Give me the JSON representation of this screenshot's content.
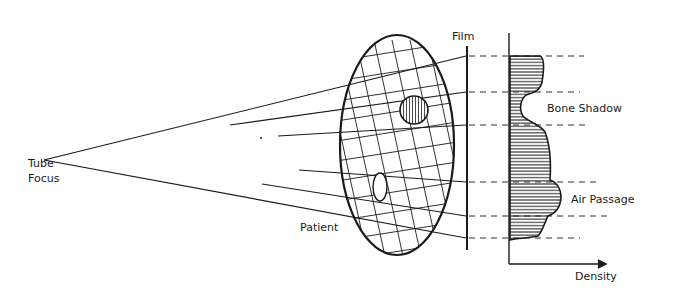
{
  "labels": {
    "tube_focus_line1": "Tube",
    "tube_focus_line2": "Focus",
    "film": "Film",
    "patient": "Patient",
    "bone_shadow": "Bone Shadow",
    "air_passage": "Air Passage",
    "density": "Density"
  },
  "colors": {
    "ink": "#1a1a1a",
    "background": "#ffffff"
  }
}
